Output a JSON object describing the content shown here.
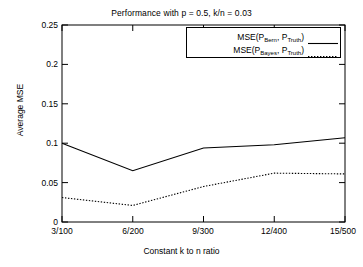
{
  "chart_data": {
    "type": "line",
    "title": "Performance with p = 0.5, k/n = 0.03",
    "xlabel": "Constant k to n ratio",
    "ylabel": "Average MSE",
    "categories": [
      "3/100",
      "6/200",
      "9/300",
      "12/400",
      "15/500"
    ],
    "ylim": [
      0,
      0.25
    ],
    "yticks": [
      "0",
      "0.05",
      "0.1",
      "0.15",
      "0.2",
      "0.25"
    ],
    "ytick_values": [
      0,
      0.05,
      0.1,
      0.15,
      0.2,
      0.25
    ],
    "grid": false,
    "legend_position": "top-right",
    "series": [
      {
        "name": "MSE(P_Bern, P_Truth)",
        "label_main": "MSE(P",
        "label_sub1": "Bern",
        "label_mid": ", P",
        "label_sub2": "Truth",
        "label_end": ")",
        "style": "solid",
        "color": "#000000",
        "values": [
          0.1,
          0.065,
          0.094,
          0.098,
          0.107
        ]
      },
      {
        "name": "MSE(P_Bayes, P_Truth)",
        "label_main": "MSE(P",
        "label_sub1": "Bayes",
        "label_mid": ", P",
        "label_sub2": "Truth",
        "label_end": ")",
        "style": "dotted",
        "color": "#000000",
        "values": [
          0.031,
          0.021,
          0.045,
          0.062,
          0.061
        ]
      }
    ]
  }
}
